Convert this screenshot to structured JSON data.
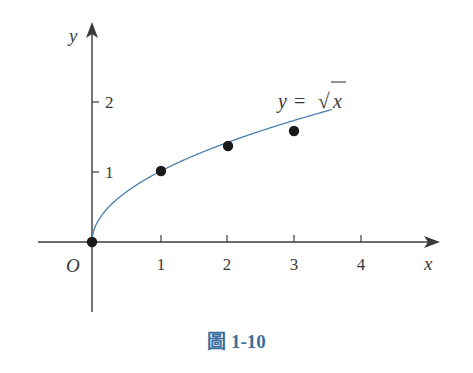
{
  "chart_data": {
    "type": "line",
    "title": "",
    "function_label": "y = √x",
    "xlabel": "x",
    "ylabel": "y",
    "origin_label": "O",
    "x_ticks": [
      "1",
      "2",
      "3",
      "4"
    ],
    "y_ticks": [
      "1",
      "2"
    ],
    "xlim": [
      -0.8,
      5.2
    ],
    "ylim": [
      -1.2,
      3.1
    ],
    "grid": false,
    "legend": null,
    "series": [
      {
        "name": "y = √x",
        "color": "#4a7fb0",
        "x_range": [
          0,
          3.58
        ],
        "marked_points": [
          {
            "x": 0,
            "y": 0
          },
          {
            "x": 1,
            "y": 1
          },
          {
            "x": 2,
            "y": 1.414
          },
          {
            "x": 3,
            "y": 1.732
          }
        ]
      }
    ]
  },
  "caption": {
    "text": "圖 1-10",
    "color": "#3b6e9e"
  }
}
